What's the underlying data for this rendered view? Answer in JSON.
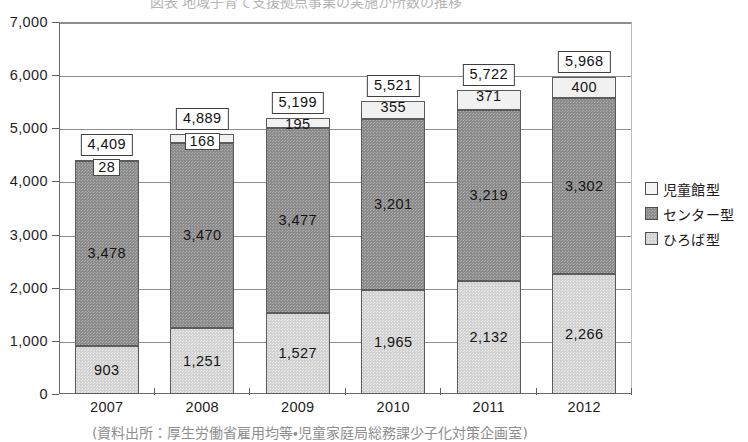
{
  "chart_data": {
    "type": "bar",
    "subtype": "stacked-vertical",
    "title": "",
    "xlabel": "",
    "ylabel": "",
    "ylim": [
      0,
      7000
    ],
    "ytick_step": 1000,
    "yticks": [
      "0",
      "1,000",
      "2,000",
      "3,000",
      "4,000",
      "5,000",
      "6,000",
      "7,000"
    ],
    "ytick_values": [
      0,
      1000,
      2000,
      3000,
      4000,
      5000,
      6000,
      7000
    ],
    "grid": "horizontal",
    "legend_position": "right",
    "categories": [
      "2007",
      "2008",
      "2009",
      "2010",
      "2011",
      "2012"
    ],
    "series": [
      {
        "name": "ひろば型",
        "color": "#d2d2d2",
        "values": [
          903,
          1251,
          1527,
          1965,
          2132,
          2266
        ],
        "labels": [
          "903",
          "1,251",
          "1,527",
          "1,965",
          "2,132",
          "2,266"
        ],
        "label_boxed": [
          false,
          false,
          false,
          false,
          false,
          false
        ]
      },
      {
        "name": "センター型",
        "color": "#8b8b8b",
        "values": [
          3478,
          3470,
          3477,
          3201,
          3219,
          3302
        ],
        "labels": [
          "3,478",
          "3,470",
          "3,477",
          "3,201",
          "3,219",
          "3,302"
        ],
        "label_boxed": [
          false,
          false,
          false,
          false,
          false,
          false
        ]
      },
      {
        "name": "児童館型",
        "color": "#f1f1f1",
        "values": [
          28,
          168,
          195,
          355,
          371,
          400
        ],
        "labels": [
          "28",
          "168",
          "195",
          "355",
          "371",
          "400"
        ],
        "label_boxed": [
          true,
          true,
          false,
          false,
          false,
          false
        ]
      }
    ],
    "totals": [
      4409,
      4889,
      5199,
      5521,
      5722,
      5968
    ],
    "total_labels": [
      "4,409",
      "4,889",
      "5,199",
      "5,521",
      "5,722",
      "5,968"
    ]
  },
  "legend": {
    "items": [
      {
        "label": "児童館型",
        "swatch": "legend-swatch-jidoukan"
      },
      {
        "label": "センター型",
        "swatch": "legend-swatch-center"
      },
      {
        "label": "ひろば型",
        "swatch": "legend-swatch-hiroba"
      }
    ]
  },
  "caption": {
    "text": "(資料出所：厚生労働省雇用均等・児童家庭局総務課少子化対策企画室)"
  },
  "page_title": {
    "text": "図表 地域子育て支援拠点事業の実施か所数の推移"
  }
}
